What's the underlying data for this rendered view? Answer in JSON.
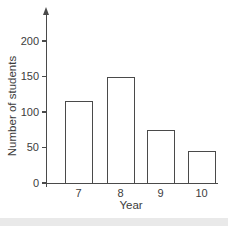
{
  "chart_data": {
    "type": "bar",
    "title": "",
    "categories": [
      "7",
      "8",
      "9",
      "10"
    ],
    "values": [
      115,
      150,
      75,
      45
    ],
    "xlabel": "Year",
    "ylabel": "Number of students",
    "y_ticks": [
      0,
      50,
      100,
      150,
      200
    ],
    "ylim": [
      0,
      240
    ],
    "grid": false,
    "legend": "none",
    "bar_fill": "#ffffff",
    "bar_border": "#4a4a4a",
    "axis_color": "#4a4a4a",
    "text_color": "#3c3c3c",
    "background": "#ffffff",
    "footer_strip_color": "#e9e9e9"
  }
}
